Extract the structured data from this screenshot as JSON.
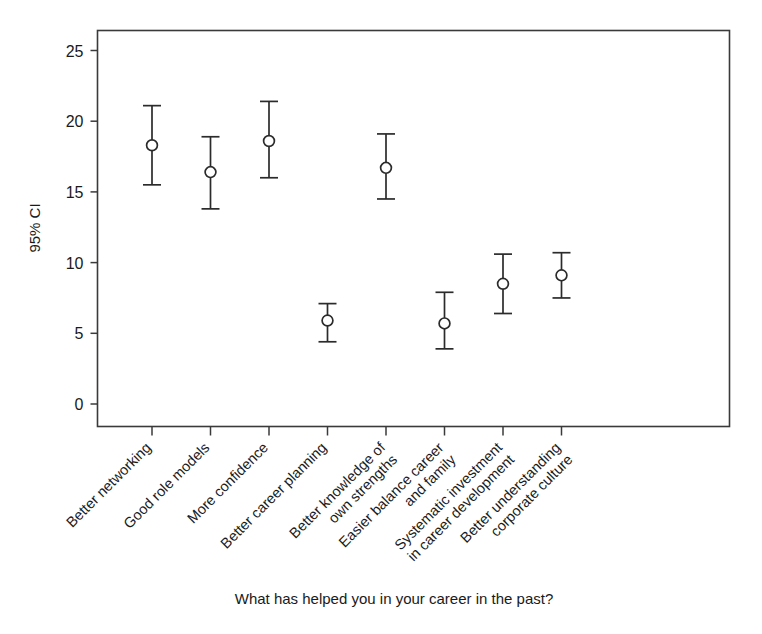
{
  "chart_data": {
    "type": "scatter",
    "title": "",
    "xlabel": "What has helped you in your career in the past?",
    "ylabel": "95% CI",
    "ylim": [
      -1.5,
      26.3
    ],
    "yticks": [
      0,
      5,
      10,
      15,
      20,
      25
    ],
    "ytick_labels": [
      "0",
      "5",
      "10",
      "15",
      "20",
      "25"
    ],
    "grid": false,
    "legend": "none",
    "marker": "open-circle",
    "error_bars": "95% confidence interval",
    "categories": [
      "Better networking",
      "Good role models",
      "More confidence",
      "Better career planning",
      "Better knowledge of\nown strengths",
      "Easier balance career\nand family",
      "Systematic investment\nin career development",
      "Better understanding\ncorporate culture"
    ],
    "category_lines": [
      [
        "Better networking"
      ],
      [
        "Good role models"
      ],
      [
        "More confidence"
      ],
      [
        "Better career planning"
      ],
      [
        "Better knowledge of",
        "own strengths"
      ],
      [
        "Easier balance career",
        "and family"
      ],
      [
        "Systematic investment",
        "in career development"
      ],
      [
        "Better understanding",
        "corporate culture"
      ]
    ],
    "values": [
      18.3,
      16.4,
      18.6,
      5.9,
      16.7,
      5.7,
      8.5,
      9.1
    ],
    "ci_lower": [
      15.5,
      13.8,
      16.0,
      4.4,
      14.5,
      3.9,
      6.4,
      7.5
    ],
    "ci_upper": [
      21.1,
      18.9,
      21.4,
      7.1,
      19.1,
      7.9,
      10.6,
      10.7
    ],
    "points": [
      {
        "category": "Better networking",
        "mean": 18.3,
        "low": 15.5,
        "high": 21.1
      },
      {
        "category": "Good role models",
        "mean": 16.4,
        "low": 13.8,
        "high": 18.9
      },
      {
        "category": "More confidence",
        "mean": 18.6,
        "low": 16.0,
        "high": 21.4
      },
      {
        "category": "Better career planning",
        "mean": 5.9,
        "low": 4.4,
        "high": 7.1
      },
      {
        "category": "Better knowledge of own strengths",
        "mean": 16.7,
        "low": 14.5,
        "high": 19.1
      },
      {
        "category": "Easier balance career and family",
        "mean": 5.7,
        "low": 3.9,
        "high": 7.9
      },
      {
        "category": "Systematic investment in career development",
        "mean": 8.5,
        "low": 6.4,
        "high": 10.6
      },
      {
        "category": "Better understanding corporate culture",
        "mean": 9.1,
        "low": 7.5,
        "high": 10.7
      }
    ],
    "colors": {
      "axis": "#3a3a3a",
      "marker_edge": "#2b2b2b",
      "marker_fill": "#ffffff",
      "error_bar": "#2b2b2b",
      "background": "#ffffff",
      "text": "#1a1a1a"
    }
  }
}
